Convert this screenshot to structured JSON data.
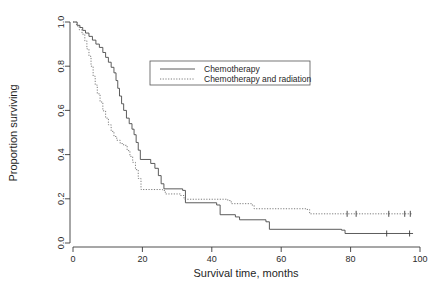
{
  "chart_data": {
    "type": "line",
    "title": "",
    "xlabel": "Survival time, months",
    "ylabel": "Proportion surviving",
    "xlim": [
      0,
      100
    ],
    "ylim": [
      0.0,
      1.0
    ],
    "xticks": [
      0,
      20,
      40,
      60,
      80,
      100
    ],
    "yticks": [
      0.0,
      0.2,
      0.4,
      0.6,
      0.8,
      1.0
    ],
    "xtick_labels": [
      "0",
      "20",
      "40",
      "60",
      "80",
      "100"
    ],
    "ytick_labels": [
      "0.0",
      "0.2",
      "0.4",
      "0.6",
      "0.8",
      "1.0"
    ],
    "grid": false,
    "legend_position": "upper center",
    "series": [
      {
        "name": "Chemotherapy",
        "style": "solid",
        "color": "#4a4a4a",
        "steps": [
          [
            0,
            1.0
          ],
          [
            1.2,
            0.985
          ],
          [
            2.0,
            0.975
          ],
          [
            2.8,
            0.962
          ],
          [
            3.6,
            0.95
          ],
          [
            4.6,
            0.935
          ],
          [
            5.6,
            0.918
          ],
          [
            6.6,
            0.9
          ],
          [
            7.6,
            0.885
          ],
          [
            8.6,
            0.862
          ],
          [
            9.4,
            0.84
          ],
          [
            10.2,
            0.818
          ],
          [
            11.0,
            0.795
          ],
          [
            11.8,
            0.77
          ],
          [
            12.4,
            0.735
          ],
          [
            12.9,
            0.7
          ],
          [
            13.4,
            0.665
          ],
          [
            14.0,
            0.63
          ],
          [
            14.6,
            0.6
          ],
          [
            15.4,
            0.565
          ],
          [
            16.2,
            0.54
          ],
          [
            17.0,
            0.515
          ],
          [
            17.6,
            0.49
          ],
          [
            18.2,
            0.455
          ],
          [
            18.8,
            0.42
          ],
          [
            19.4,
            0.378
          ],
          [
            22.4,
            0.36
          ],
          [
            23.6,
            0.338
          ],
          [
            24.6,
            0.305
          ],
          [
            25.4,
            0.268
          ],
          [
            26.2,
            0.245
          ],
          [
            31.6,
            0.238
          ],
          [
            32.4,
            0.182
          ],
          [
            41.4,
            0.172
          ],
          [
            42.4,
            0.128
          ],
          [
            46.8,
            0.118
          ],
          [
            48.0,
            0.105
          ],
          [
            55.6,
            0.096
          ],
          [
            56.6,
            0.062
          ],
          [
            77.4,
            0.058
          ],
          [
            78.4,
            0.043
          ],
          [
            98.0,
            0.043
          ]
        ],
        "censored": [
          [
            90.4,
            0.043
          ],
          [
            97.0,
            0.043
          ]
        ],
        "plateau_value": 0.043
      },
      {
        "name": "Chemotherapy and radiation",
        "style": "dotted",
        "color": "#6e6e6e",
        "steps": [
          [
            0,
            1.0
          ],
          [
            1.0,
            0.982
          ],
          [
            1.8,
            0.965
          ],
          [
            2.6,
            0.945
          ],
          [
            3.4,
            0.915
          ],
          [
            4.0,
            0.878
          ],
          [
            4.6,
            0.845
          ],
          [
            5.2,
            0.8
          ],
          [
            5.8,
            0.755
          ],
          [
            6.4,
            0.715
          ],
          [
            7.0,
            0.675
          ],
          [
            7.8,
            0.638
          ],
          [
            8.6,
            0.598
          ],
          [
            9.4,
            0.565
          ],
          [
            10.2,
            0.535
          ],
          [
            11.0,
            0.505
          ],
          [
            11.8,
            0.482
          ],
          [
            12.6,
            0.465
          ],
          [
            13.6,
            0.45
          ],
          [
            14.6,
            0.442
          ],
          [
            15.6,
            0.418
          ],
          [
            16.4,
            0.392
          ],
          [
            17.2,
            0.365
          ],
          [
            18.0,
            0.332
          ],
          [
            18.8,
            0.292
          ],
          [
            19.6,
            0.242
          ],
          [
            25.8,
            0.238
          ],
          [
            26.6,
            0.222
          ],
          [
            31.0,
            0.215
          ],
          [
            32.0,
            0.198
          ],
          [
            44.6,
            0.192
          ],
          [
            45.6,
            0.178
          ],
          [
            51.4,
            0.172
          ],
          [
            52.2,
            0.155
          ],
          [
            67.2,
            0.152
          ],
          [
            68.2,
            0.132
          ],
          [
            98.0,
            0.132
          ]
        ],
        "censored": [
          [
            79.0,
            0.132
          ],
          [
            81.6,
            0.132
          ],
          [
            91.0,
            0.132
          ],
          [
            95.6,
            0.132
          ],
          [
            97.2,
            0.132
          ]
        ],
        "plateau_value": 0.132
      }
    ]
  },
  "legend": {
    "entries": [
      {
        "label": "Chemotherapy",
        "style": "solid"
      },
      {
        "label": "Chemotherapy and radiation",
        "style": "dotted"
      }
    ]
  }
}
